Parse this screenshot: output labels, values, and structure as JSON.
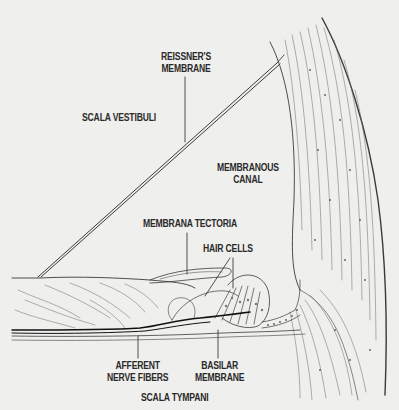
{
  "diagram": {
    "background": "#efefed",
    "ink": "#2a2a2a",
    "labels": {
      "reissners_membrane": {
        "line1": "REISSNER'S",
        "line2": "MEMBRANE"
      },
      "scala_vestibuli": "SCALA VESTIBULI",
      "membranous_canal": {
        "line1": "MEMBRANOUS",
        "line2": "CANAL"
      },
      "membrana_tectoria": "MEMBRANA TECTORIA",
      "hair_cells": "HAIR CELLS",
      "afferent_nerve_fibers": {
        "line1": "AFFERENT",
        "line2": "NERVE FIBERS"
      },
      "basilar_membrane": {
        "line1": "BASILAR",
        "line2": "MEMBRANE"
      },
      "scala_tympani": "SCALA TYMPANI"
    }
  }
}
